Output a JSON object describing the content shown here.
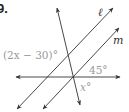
{
  "problem_number": "9.",
  "labels": {
    "line_l": "ℓ",
    "line_m": "m",
    "angle_1": "(2x − 30)°",
    "angle_2": "45°",
    "angle_3": "x°"
  },
  "colors": {
    "line": "#333333",
    "label": "#9a9a9a",
    "italic_label": "#333333"
  }
}
